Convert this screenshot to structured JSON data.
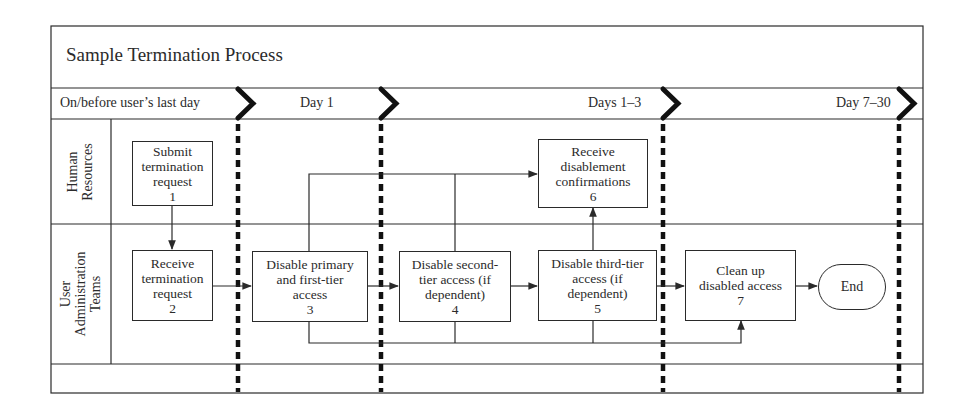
{
  "diagram": {
    "title": "Sample Termination Process",
    "phases": [
      {
        "label": "On/before user’s last day"
      },
      {
        "label": "Day 1"
      },
      {
        "label": "Days 1–3"
      },
      {
        "label": "Day 7–30"
      }
    ],
    "lanes": [
      {
        "label_line1": "Human",
        "label_line2": "Resources"
      },
      {
        "label_line1": "User",
        "label_line2": "Administration",
        "label_line3": "Teams"
      }
    ],
    "steps": [
      {
        "id": 1,
        "lane": "Human Resources",
        "lines": [
          "Submit",
          "termination",
          "request"
        ],
        "number": "1"
      },
      {
        "id": 2,
        "lane": "User Administration Teams",
        "lines": [
          "Receive",
          "termination",
          "request"
        ],
        "number": "2"
      },
      {
        "id": 3,
        "lane": "User Administration Teams",
        "lines": [
          "Disable primary",
          "and first-tier",
          "access"
        ],
        "number": "3"
      },
      {
        "id": 4,
        "lane": "User Administration Teams",
        "lines": [
          "Disable second-",
          "tier access (if",
          "dependent)"
        ],
        "number": "4"
      },
      {
        "id": 5,
        "lane": "User Administration Teams",
        "lines": [
          "Disable third-tier",
          "access (if",
          "dependent)"
        ],
        "number": "5"
      },
      {
        "id": 6,
        "lane": "Human Resources",
        "lines": [
          "Receive",
          "disablement",
          "confirmations"
        ],
        "number": "6"
      },
      {
        "id": 7,
        "lane": "User Administration Teams",
        "lines": [
          "Clean up",
          "disabled access"
        ],
        "number": "7"
      }
    ],
    "terminal": {
      "label": "End"
    },
    "flows": [
      {
        "from": 1,
        "to": 2
      },
      {
        "from": 2,
        "to": 3
      },
      {
        "from": 3,
        "to": 4
      },
      {
        "from": 4,
        "to": 5
      },
      {
        "from": 5,
        "to": 7
      },
      {
        "from": 7,
        "to": "End"
      },
      {
        "from": 3,
        "to": 6
      },
      {
        "from": 4,
        "to": 6
      },
      {
        "from": 5,
        "to": 6
      },
      {
        "from": 3,
        "to": 7
      },
      {
        "from": 4,
        "to": 7
      },
      {
        "from": 5,
        "to": 7
      }
    ],
    "colors": {
      "line": "#2a2a2a",
      "divider": "#111111",
      "background": "#ffffff"
    }
  }
}
